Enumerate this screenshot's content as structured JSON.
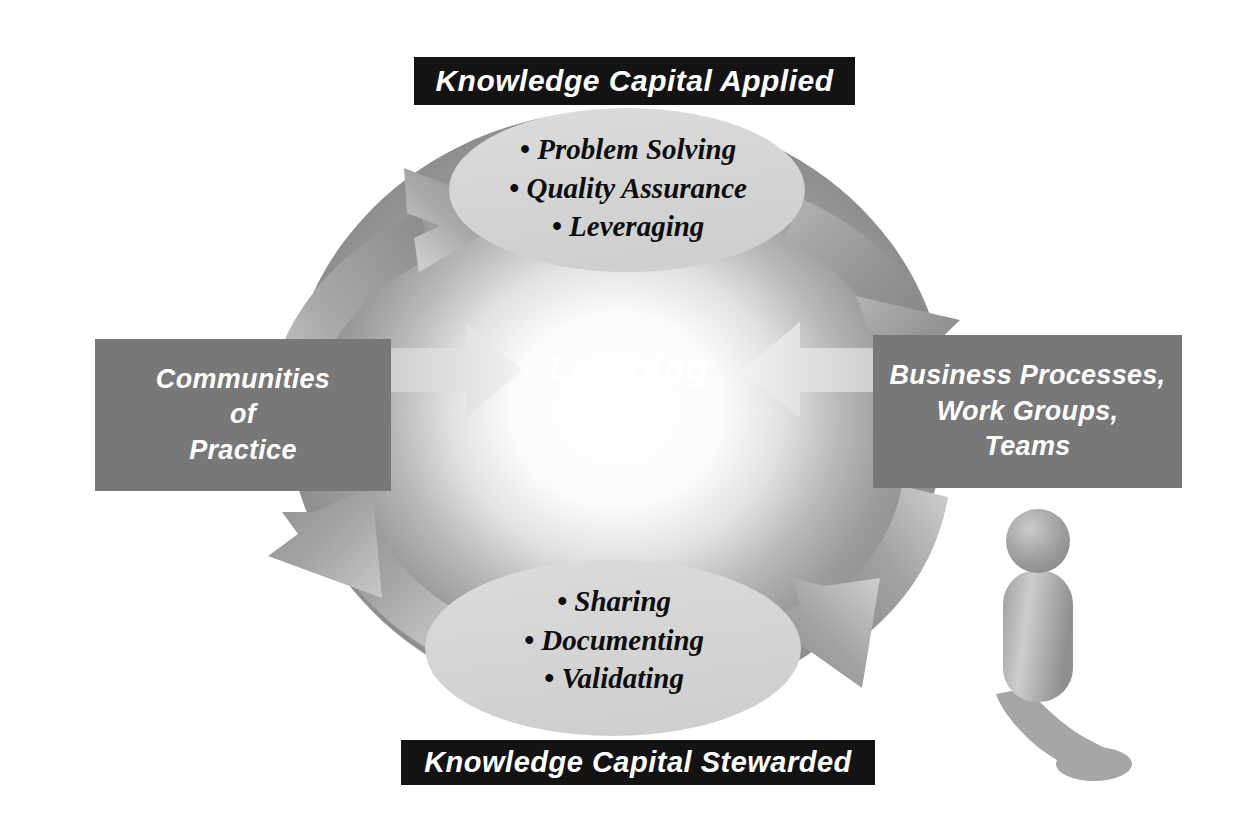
{
  "diagram": {
    "center_label": "Learning",
    "banners": {
      "top": "Knowledge Capital Applied",
      "bottom": "Knowledge Capital Stewarded"
    },
    "nodes": {
      "top_ellipse": {
        "name": "Knowledge Capital Applied",
        "items": [
          "• Problem Solving",
          "• Quality Assurance",
          "• Leveraging"
        ]
      },
      "bottom_ellipse": {
        "name": "Knowledge Capital Stewarded",
        "items": [
          "• Sharing",
          "• Documenting",
          "• Validating"
        ]
      },
      "left_box": {
        "lines": [
          "Communities",
          "of",
          "Practice"
        ]
      },
      "right_box": {
        "lines": [
          "Business Processes,",
          "Work Groups,",
          "Teams"
        ]
      }
    },
    "flow": [
      "Communities of Practice -> Knowledge Capital Applied",
      "Knowledge Capital Applied -> Business Processes, Work Groups, Teams",
      "Business Processes, Work Groups, Teams -> Knowledge Capital Stewarded",
      "Knowledge Capital Stewarded -> Communities of Practice",
      "Communities of Practice -> Learning",
      "Business Processes, Work Groups, Teams -> Learning"
    ],
    "colors": {
      "banner_background": "#131313",
      "banner_text": "#ffffff",
      "box_background": "#787878",
      "box_text": "#ffffff",
      "ellipse_fill": "#d6d6d6",
      "ellipse_text": "#0d0d0d",
      "arrow_gray": "#8d8d8d",
      "arrow_light": "#dcdcdc",
      "center_glow": "#ffffff",
      "figure_gray": "#9a9a9a",
      "page_background": "#ffffff"
    },
    "figure": {
      "name": "person-silhouette",
      "description": "stylized gray human figure with shadow"
    }
  }
}
